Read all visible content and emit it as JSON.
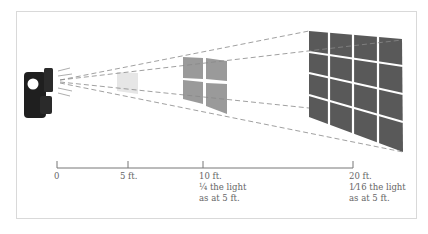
{
  "diagram": {
    "colors": {
      "frame": "#d9d9d9",
      "flash": "#1f1f1f",
      "near_square": "#e6e6e6",
      "mid_grid": "#9a9a9a",
      "far_grid": "#595959",
      "ray": "#888888",
      "axis": "#777777",
      "text": "#666666"
    },
    "axis": {
      "ticks": [
        {
          "label": "0",
          "x": 57
        },
        {
          "label": "5 ft.",
          "x": 128
        },
        {
          "label": "10 ft.",
          "x": 203
        },
        {
          "label": "20 ft.",
          "x": 353
        }
      ],
      "annotations": [
        {
          "at": "10 ft.",
          "fraction": "¼",
          "line1": " the light",
          "line2": "as at 5 ft."
        },
        {
          "at": "20 ft.",
          "fraction": "1⁄16",
          "line1": " the light",
          "line2": "as at 5 ft."
        }
      ]
    },
    "panels": [
      {
        "name": "5 ft. panel",
        "grid": "1x1"
      },
      {
        "name": "10 ft. panel",
        "grid": "2x2"
      },
      {
        "name": "20 ft. panel",
        "grid": "4x4"
      }
    ]
  }
}
